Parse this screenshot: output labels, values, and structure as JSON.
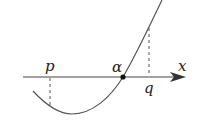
{
  "diagram": {
    "type": "function-graph",
    "axis": {
      "label": "x",
      "direction": "right-arrow"
    },
    "labels": {
      "p": "p",
      "alpha": "α",
      "q": "q",
      "x": "x"
    },
    "points": [
      {
        "name": "p",
        "position": "left of vertex, curve below axis"
      },
      {
        "name": "alpha",
        "position": "root of curve, marked with dot"
      },
      {
        "name": "q",
        "position": "right of alpha, curve above axis"
      }
    ],
    "colors": {
      "stroke": "#444444",
      "text": "#222222",
      "background": "#ffffff"
    }
  }
}
